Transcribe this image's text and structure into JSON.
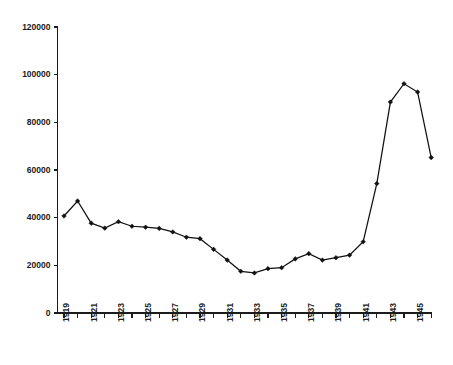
{
  "chart_data": {
    "type": "line",
    "title": "",
    "subtitle": "",
    "xlabel": "",
    "ylabel": "",
    "categories": [
      1919,
      1920,
      1921,
      1922,
      1923,
      1924,
      1925,
      1926,
      1927,
      1928,
      1929,
      1930,
      1931,
      1932,
      1933,
      1934,
      1935,
      1936,
      1937,
      1938,
      1939,
      1940,
      1941,
      1942,
      1943,
      1944,
      1945,
      1946
    ],
    "values": [
      40700,
      47000,
      37700,
      35600,
      38300,
      36400,
      36000,
      35500,
      34000,
      31800,
      31200,
      26700,
      22200,
      17500,
      16800,
      18600,
      19000,
      22700,
      24900,
      22200,
      23200,
      24300,
      29900,
      54300,
      88500,
      96200,
      92700,
      65200
    ],
    "series": [
      {
        "name": "",
        "values": [
          40700,
          47000,
          37700,
          35600,
          38300,
          36400,
          36000,
          35500,
          34000,
          31800,
          31200,
          26700,
          22200,
          17500,
          16800,
          18600,
          19000,
          22700,
          24900,
          22200,
          23200,
          24300,
          29900,
          54300,
          88500,
          96200,
          92700,
          65200
        ]
      }
    ],
    "ylim": [
      0,
      120000
    ],
    "xlim": [
      1919,
      1946
    ],
    "ytick_values": [
      0,
      20000,
      40000,
      60000,
      80000,
      100000,
      120000
    ],
    "ytick_labels": [
      "0",
      "20000",
      "40000",
      "60000",
      "80000",
      "100000",
      "120000"
    ],
    "xtick_values": [
      1919,
      1920,
      1921,
      1922,
      1923,
      1924,
      1925,
      1926,
      1927,
      1928,
      1929,
      1930,
      1931,
      1932,
      1933,
      1934,
      1935,
      1936,
      1937,
      1938,
      1939,
      1940,
      1941,
      1942,
      1943,
      1944,
      1945,
      1946
    ],
    "xtick_labels": [
      "1919",
      "",
      "1921",
      "",
      "1923",
      "",
      "1925",
      "",
      "1927",
      "",
      "1929",
      "",
      "1931",
      "",
      "1933",
      "",
      "1935",
      "",
      "1937",
      "",
      "1939",
      "",
      "1941",
      "",
      "1943",
      "",
      "1945",
      ""
    ],
    "xtick_label_rotation": -90,
    "grid": false,
    "legend": false,
    "legend_position": "none",
    "marker": "diamond",
    "line_color": "#111111",
    "marker_color": "#111111",
    "axis_color": "#1c1c1c",
    "background_color": "#ffffff"
  }
}
